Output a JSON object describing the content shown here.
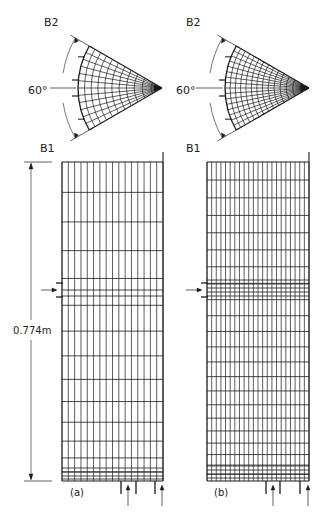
{
  "figure": {
    "panels": [
      {
        "id": "a",
        "caption": "(a)",
        "fan": {
          "label_b2": "B2",
          "label_b1": "B1",
          "angle_label": "60°",
          "radial_lines": 13,
          "arcs": 11
        },
        "mesh": {
          "columns": 16,
          "rows_note": "non-uniform, finer near bottom"
        },
        "dimension_label": "0.774m"
      },
      {
        "id": "b",
        "caption": "(b)",
        "fan": {
          "label_b2": "B2",
          "label_b1": "B1",
          "angle_label": "60°",
          "radial_lines": 17,
          "arcs": 14
        },
        "mesh": {
          "columns": 22,
          "rows_note": "non-uniform, finer near bottom and at inlet"
        }
      }
    ],
    "colors": {
      "line": "#1a1a1a",
      "background": "#ffffff"
    }
  }
}
